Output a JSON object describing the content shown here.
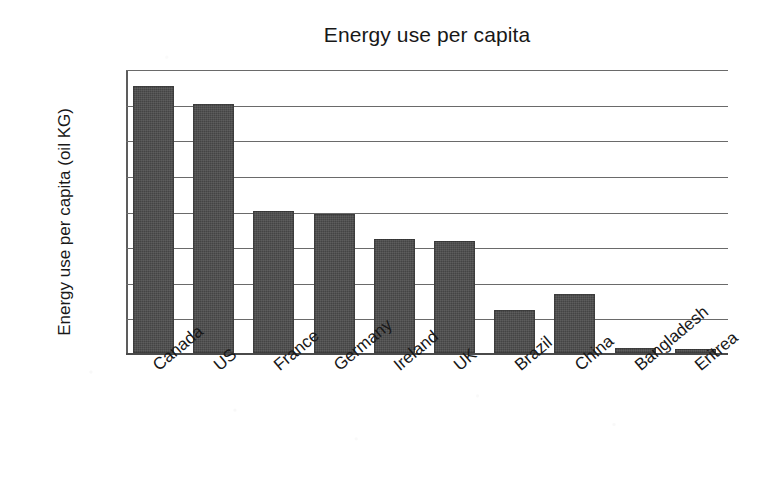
{
  "chart_data": {
    "type": "bar",
    "title": "Energy use per capita",
    "xlabel": "",
    "ylabel": "Energy use per capita (oil KG)",
    "categories": [
      "Canada",
      "US",
      "France",
      "Germany",
      "Ireland",
      "UK",
      "Brazil",
      "China",
      "Bangladesh",
      "Eritrea"
    ],
    "values": [
      7500,
      7000,
      4000,
      3900,
      3200,
      3150,
      1200,
      1650,
      150,
      100
    ],
    "ylim": [
      0,
      8000
    ],
    "y_ticks": [
      0,
      1000,
      2000,
      3000,
      4000,
      5000,
      6000,
      7000,
      8000
    ],
    "y_tick_labels": [
      "0",
      "1000",
      "2000",
      "3000",
      "4000",
      "5000",
      "6000",
      "7000",
      "8000"
    ],
    "grid": "horizontal",
    "legend": "none",
    "series": [
      {
        "name": "Energy use per capita (oil KG)",
        "values": [
          7500,
          7000,
          4000,
          3900,
          3200,
          3150,
          1200,
          1650,
          150,
          100
        ]
      }
    ],
    "bar_color": "#4b4b4b",
    "gridline_color": "#6a6a6a",
    "axis_color": "#4a4a4a",
    "background_color": "#ffffff",
    "x_tick_label_rotation": -40
  }
}
